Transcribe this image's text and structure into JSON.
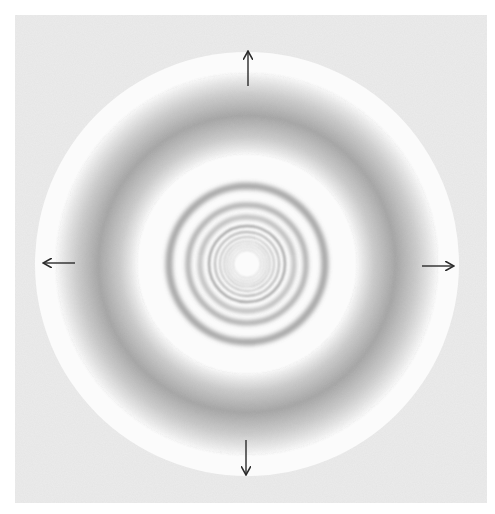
{
  "figure": {
    "colors": {
      "page_background": "#ffffff",
      "square_background": "#ececec",
      "disc_background": "#fbfbfb",
      "ring_color": "#6e6e6e",
      "arrow_color": "#2a2a2a"
    },
    "square": {
      "x": 15,
      "y": 15,
      "width": 472,
      "height": 488
    },
    "disc": {
      "cx": 247,
      "cy": 264,
      "r": 212
    },
    "rings": [
      {
        "r": 14,
        "width": 1.0,
        "opacity": 0.35
      },
      {
        "r": 17,
        "width": 1.0,
        "opacity": 0.38
      },
      {
        "r": 20,
        "width": 1.1,
        "opacity": 0.4
      },
      {
        "r": 23,
        "width": 1.2,
        "opacity": 0.45
      },
      {
        "r": 27,
        "width": 1.4,
        "opacity": 0.5
      },
      {
        "r": 32,
        "width": 1.8,
        "opacity": 0.55
      },
      {
        "r": 38,
        "width": 2.4,
        "opacity": 0.6
      },
      {
        "r": 47,
        "width": 3.4,
        "opacity": 0.62
      },
      {
        "r": 59,
        "width": 4.6,
        "opacity": 0.62
      },
      {
        "r": 78,
        "width": 7,
        "opacity": 0.6
      }
    ],
    "broad_band": {
      "inner_r": 112,
      "peak_r": 150,
      "outer_r": 192,
      "peak_opacity": 0.6
    },
    "arrows": [
      {
        "name": "arrow-up-icon",
        "direction": "up",
        "x1": 248,
        "y1": 86,
        "x2": 248,
        "y2": 52
      },
      {
        "name": "arrow-down-icon",
        "direction": "down",
        "x1": 246,
        "y1": 440,
        "x2": 246,
        "y2": 474
      },
      {
        "name": "arrow-left-icon",
        "direction": "left",
        "x1": 75,
        "y1": 263,
        "x2": 44,
        "y2": 263
      },
      {
        "name": "arrow-right-icon",
        "direction": "right",
        "x1": 422,
        "y1": 266,
        "x2": 453,
        "y2": 266
      }
    ]
  }
}
